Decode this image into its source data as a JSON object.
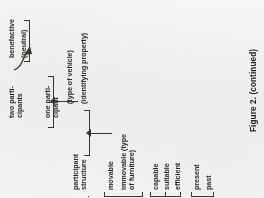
{
  "page": {
    "orientation": "rotated-90-ccw",
    "background_color": "#f3f2f0",
    "ink_color": "#2e2c2a",
    "caption": "Figure 2. (continued)"
  },
  "diagram": {
    "nodes": {
      "benefactive": "benefactive",
      "neutral": "(neutral)",
      "two_participants": "two parti-\ncipants",
      "one_participant": "one parti-\ncipant",
      "participant_structure": "participant\nstructure",
      "movable": "movable",
      "type_of_vehicle": "(type of vehicle)",
      "immovable": "immovable (type\nof furniture)",
      "identifying_property": "(identifying property)",
      "capable": "capable",
      "suitable": "suitable",
      "efficient": "efficient",
      "present": "present",
      "past": "past"
    },
    "groups": [
      {
        "name": "participant-structure-group",
        "parent": "participant structure",
        "children": [
          "two parti-cipants",
          "one parti-cipant"
        ]
      },
      {
        "name": "two-participant-subgroup",
        "parent": "two parti-cipants",
        "children": [
          "benefactive",
          "(neutral)"
        ]
      },
      {
        "name": "movability-group",
        "parent": "movable",
        "children": [
          "(type of vehicle)",
          "(identifying property)"
        ]
      },
      {
        "name": "property-group",
        "children": [
          "capable",
          "suitable",
          "efficient"
        ]
      },
      {
        "name": "tense-group",
        "children": [
          "present",
          "past"
        ]
      }
    ]
  }
}
